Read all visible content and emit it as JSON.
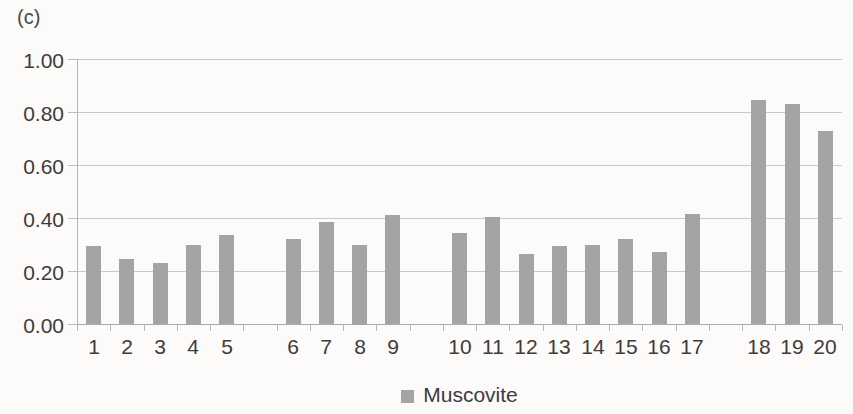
{
  "panel_label": "(c)",
  "chart_data": {
    "type": "bar",
    "title": "",
    "xlabel": "",
    "ylabel": "",
    "categories": [
      "1",
      "2",
      "3",
      "4",
      "5",
      "6",
      "7",
      "8",
      "9",
      "10",
      "11",
      "12",
      "13",
      "14",
      "15",
      "16",
      "17",
      "18",
      "19",
      "20"
    ],
    "values": [
      0.295,
      0.245,
      0.23,
      0.3,
      0.335,
      0.32,
      0.385,
      0.3,
      0.41,
      0.345,
      0.405,
      0.265,
      0.295,
      0.3,
      0.32,
      0.27,
      0.415,
      0.845,
      0.83,
      0.73
    ],
    "series_name": "Muscovite",
    "ylim": [
      0,
      1.0
    ],
    "ytick_values": [
      0,
      0.2,
      0.4,
      0.6,
      0.8,
      1.0
    ],
    "ytick_labels": [
      "0.00",
      "0.20",
      "0.40",
      "0.60",
      "0.80",
      "1.00"
    ],
    "grid": "horizontal",
    "group_gaps_after": [
      "5",
      "9",
      "17"
    ],
    "total_slots": 23,
    "legend": {
      "label": "Muscovite",
      "position": "bottom-center",
      "marker": "square"
    },
    "colors": {
      "bar": "#a4a4a4",
      "gridline": "#c9c9c9",
      "axis": "#ababab",
      "text": "#3c3c3c",
      "background": "#fcfbf9"
    }
  }
}
